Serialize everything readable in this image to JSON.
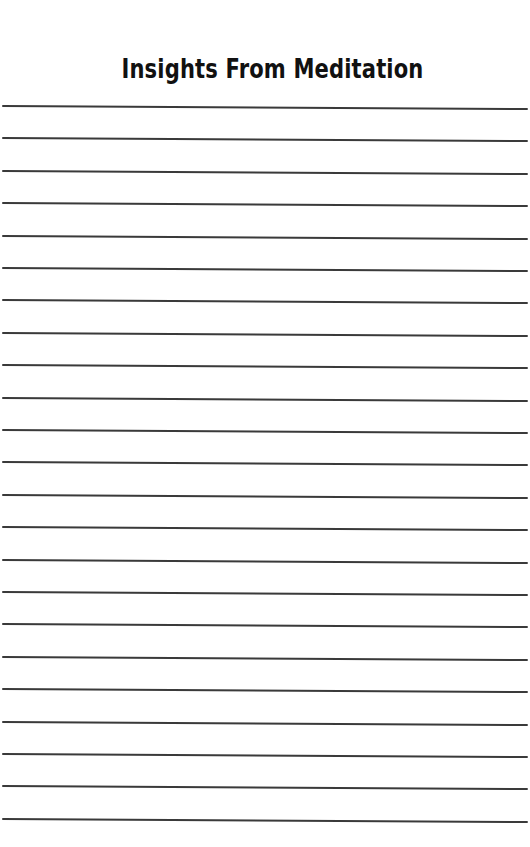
{
  "page": {
    "title": "Insights From Meditation",
    "line_color": "#3a3a3a",
    "background_color": "#ffffff",
    "line_count": 23,
    "first_line_y": 105,
    "line_spacing": 32.4
  }
}
